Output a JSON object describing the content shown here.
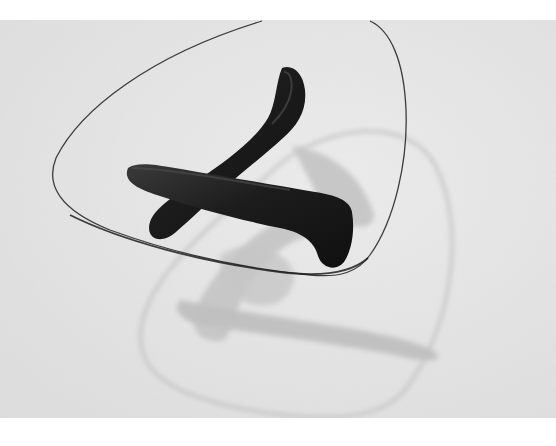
{
  "image": {
    "subject": "glass-top coffee table with dark sculpted wooden base",
    "style": "black-and-white product photograph",
    "colors": {
      "page_background": "#ffffff",
      "floor": "#e4e4e4",
      "floor_light": "#ececec",
      "shadow": "#c2c2c2",
      "glass_edge": "#3a3a3a",
      "glass_shadow_edge": "#b8b8b8",
      "base_wood": "#1e1e1e",
      "base_highlight": "#3c3c3c"
    }
  }
}
